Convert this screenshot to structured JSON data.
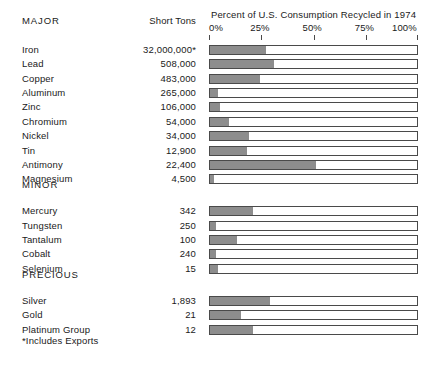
{
  "header": {
    "category_label": "MAJOR",
    "tons_label": "Short Tons",
    "chart_title": "Percent of U.S. Consumption Recycled in 1974"
  },
  "sections": {
    "minor_label": "MINOR",
    "precious_label": "PRECIOUS"
  },
  "footnote": "*Includes Exports",
  "colors": {
    "bar_fill": "#8d8d8d",
    "bar_outline": "#4a4a4a",
    "text": "#1a1a1a",
    "background": "#ffffff"
  },
  "chart_data": {
    "type": "bar",
    "orientation": "horizontal",
    "title": "Percent of U.S. Consumption Recycled in 1974",
    "xlabel": "Percent of U.S. Consumption Recycled in 1974",
    "ylabel": "",
    "xlim": [
      0,
      100
    ],
    "tick_labels": [
      "0%",
      "25%",
      "50%",
      "75%",
      "100%"
    ],
    "tick_values": [
      0,
      25,
      50,
      75,
      100
    ],
    "grid": false,
    "legend": "none",
    "value_unit": "percent",
    "secondary_column": {
      "name": "Short Tons",
      "unit": "short tons"
    },
    "groups": [
      {
        "name": "MAJOR",
        "categories": [
          "Iron",
          "Lead",
          "Copper",
          "Aluminum",
          "Zinc",
          "Chromium",
          "Nickel",
          "Tin",
          "Antimony",
          "Magnesium"
        ],
        "values": [
          27,
          31,
          24,
          4,
          5,
          9,
          19,
          18,
          51,
          2
        ],
        "short_tons": [
          "32,000,000*",
          "508,000",
          "483,000",
          "265,000",
          "106,000",
          "54,000",
          "34,000",
          "12,900",
          "22,400",
          "4,500"
        ]
      },
      {
        "name": "MINOR",
        "categories": [
          "Mercury",
          "Tungsten",
          "Tantalum",
          "Cobalt",
          "Selenium"
        ],
        "values": [
          21,
          3,
          13,
          3,
          4
        ],
        "short_tons": [
          "342",
          "250",
          "100",
          "240",
          "15"
        ]
      },
      {
        "name": "PRECIOUS",
        "categories": [
          "Silver",
          "Gold",
          "Platinum Group"
        ],
        "values": [
          29,
          15,
          21
        ],
        "short_tons": [
          "1,893",
          "21",
          "12"
        ]
      }
    ]
  },
  "layout": {
    "rows": [
      {
        "group": 0,
        "index": 0,
        "top": 44
      },
      {
        "group": 0,
        "index": 1,
        "top": 61
      },
      {
        "group": 0,
        "index": 2,
        "top": 78
      },
      {
        "group": 0,
        "index": 3,
        "top": 95
      },
      {
        "group": 0,
        "index": 4,
        "top": 112
      },
      {
        "group": 0,
        "index": 5,
        "top": 129
      },
      {
        "group": 0,
        "index": 6,
        "top": 146
      },
      {
        "group": 0,
        "index": 7,
        "top": 163
      },
      {
        "group": 0,
        "index": 8,
        "top": 180
      },
      {
        "group": 0,
        "index": 9,
        "top": 197
      },
      {
        "group": 1,
        "index": 0,
        "top": 235
      },
      {
        "group": 1,
        "index": 1,
        "top": 252
      },
      {
        "group": 1,
        "index": 2,
        "top": 269
      },
      {
        "group": 1,
        "index": 3,
        "top": 286
      },
      {
        "group": 1,
        "index": 4,
        "top": 303
      },
      {
        "group": 2,
        "index": 0,
        "top": 341
      },
      {
        "group": 2,
        "index": 1,
        "top": 358
      },
      {
        "group": 2,
        "index": 2,
        "top": 375
      }
    ]
  }
}
